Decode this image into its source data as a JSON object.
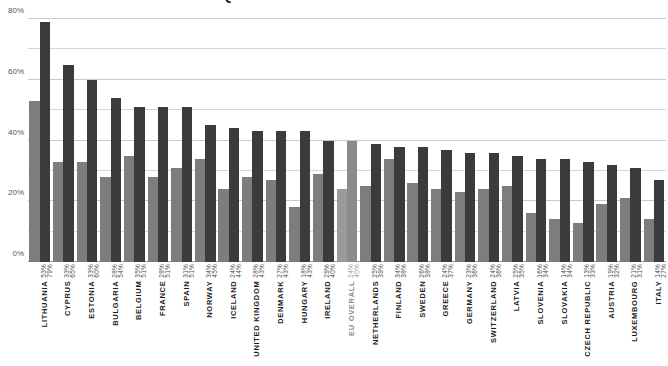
{
  "chart_data": {
    "type": "bar",
    "title": "SENIORS  QUESTIONS  EMPLOYMENT  IN EUROPE",
    "xlabel": "",
    "ylabel": "",
    "ylim": [
      0,
      80
    ],
    "ytick_labels": [
      "0%",
      "20%",
      "40%",
      "60%",
      "80%"
    ],
    "ytick_values": [
      0,
      20,
      40,
      60,
      80
    ],
    "minor_gridlines": [
      10,
      30,
      50,
      70
    ],
    "grid": true,
    "legend_position": "none",
    "value_suffix": "%",
    "series": [
      {
        "name": "series-1",
        "color": "#7d7d7d",
        "values": [
          53,
          33,
          33,
          28,
          35,
          28,
          31,
          34,
          24,
          28,
          27,
          18,
          29,
          24,
          25,
          34,
          26,
          24,
          23,
          24,
          25,
          16,
          14,
          13,
          19,
          21,
          14
        ]
      },
      {
        "name": "series-2",
        "color": "#3b3b3b",
        "values": [
          79,
          65,
          60,
          54,
          51,
          51,
          51,
          45,
          44,
          43,
          43,
          43,
          40,
          40,
          39,
          38,
          38,
          37,
          36,
          36,
          35,
          34,
          34,
          33,
          32,
          31,
          27
        ]
      }
    ],
    "categories": [
      "LITHUANIA",
      "CYPRUS",
      "ESTONIA",
      "BULGARIA",
      "BELGIUM",
      "FRANCE",
      "SPAIN",
      "NORWAY",
      "ICELAND",
      "UNITED KINGDOM",
      "DENMARK",
      "HUNGARY",
      "IRELAND",
      "EU OVERALL",
      "NETHERLANDS",
      "FINLAND",
      "SWEDEN",
      "GREECE",
      "GERMANY",
      "SWITZERLAND",
      "LATVIA",
      "SLOVENIA",
      "SLOVAKIA",
      "CZECH REPUBLIC",
      "AUSTRIA",
      "LUXEMBOURG",
      "ITALY"
    ],
    "highlight_category": "EU OVERALL",
    "point_labels": [
      {
        "category": "LITHUANIA",
        "v1": "53%",
        "v2": "79%"
      },
      {
        "category": "CYPRUS",
        "v1": "33%",
        "v2": "65%"
      },
      {
        "category": "ESTONIA",
        "v1": "33%",
        "v2": "60%"
      },
      {
        "category": "BULGARIA",
        "v1": "28%",
        "v2": "54%"
      },
      {
        "category": "BELGIUM",
        "v1": "35%",
        "v2": "51%"
      },
      {
        "category": "FRANCE",
        "v1": "28%",
        "v2": "51%"
      },
      {
        "category": "SPAIN",
        "v1": "31%",
        "v2": "51%"
      },
      {
        "category": "NORWAY",
        "v1": "34%",
        "v2": "45%"
      },
      {
        "category": "ICELAND",
        "v1": "24%",
        "v2": "44%"
      },
      {
        "category": "UNITED KINGDOM",
        "v1": "28%",
        "v2": "43%"
      },
      {
        "category": "DENMARK",
        "v1": "27%",
        "v2": "43%"
      },
      {
        "category": "HUNGARY",
        "v1": "18%",
        "v2": "43%"
      },
      {
        "category": "IRELAND",
        "v1": "29%",
        "v2": "40%"
      },
      {
        "category": "EU OVERALL",
        "v1": "24%",
        "v2": "40%"
      },
      {
        "category": "NETHERLANDS",
        "v1": "25%",
        "v2": "39%"
      },
      {
        "category": "FINLAND",
        "v1": "34%",
        "v2": "38%"
      },
      {
        "category": "SWEDEN",
        "v1": "26%",
        "v2": "38%"
      },
      {
        "category": "GREECE",
        "v1": "24%",
        "v2": "37%"
      },
      {
        "category": "GERMANY",
        "v1": "23%",
        "v2": "36%"
      },
      {
        "category": "SWITZERLAND",
        "v1": "24%",
        "v2": "36%"
      },
      {
        "category": "LATVIA",
        "v1": "25%",
        "v2": "35%"
      },
      {
        "category": "SLOVENIA",
        "v1": "16%",
        "v2": "34%"
      },
      {
        "category": "SLOVAKIA",
        "v1": "14%",
        "v2": "34%"
      },
      {
        "category": "CZECH REPUBLIC",
        "v1": "13%",
        "v2": "33%"
      },
      {
        "category": "AUSTRIA",
        "v1": "19%",
        "v2": "32%"
      },
      {
        "category": "LUXEMBOURG",
        "v1": "21%",
        "v2": "31%"
      },
      {
        "category": "ITALY",
        "v1": "14%",
        "v2": "27%"
      }
    ]
  }
}
